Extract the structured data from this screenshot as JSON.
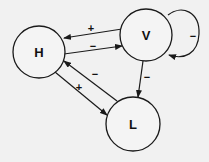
{
  "diagram": {
    "nodes": [
      {
        "id": "H",
        "label": "H",
        "cx": 39,
        "cy": 52,
        "r": 26
      },
      {
        "id": "V",
        "label": "V",
        "cx": 146,
        "cy": 35,
        "r": 26
      },
      {
        "id": "L",
        "label": "L",
        "cx": 133,
        "cy": 124,
        "r": 27
      }
    ],
    "edges": [
      {
        "from": "V",
        "to": "H",
        "sign": "+",
        "x1": 122,
        "y1": 29,
        "x2": 64,
        "y2": 38,
        "lx": 91,
        "ly": 28
      },
      {
        "from": "H",
        "to": "V",
        "sign": "−",
        "x1": 64,
        "y1": 54,
        "x2": 122,
        "y2": 46,
        "lx": 93,
        "ly": 46
      },
      {
        "from": "H",
        "to": "L",
        "sign": "+",
        "x1": 55,
        "y1": 72,
        "x2": 107,
        "y2": 115,
        "lx": 79,
        "ly": 87
      },
      {
        "from": "L",
        "to": "H",
        "sign": "−",
        "x1": 117,
        "y1": 101,
        "x2": 64,
        "y2": 61,
        "lx": 95,
        "ly": 74
      },
      {
        "from": "V",
        "to": "L",
        "sign": "−",
        "x1": 143,
        "y1": 61,
        "x2": 138,
        "y2": 97,
        "lx": 147,
        "ly": 77
      },
      {
        "from": "V",
        "to": "V",
        "sign": "−",
        "self_loop": true,
        "lx": 193,
        "ly": 36
      }
    ]
  }
}
